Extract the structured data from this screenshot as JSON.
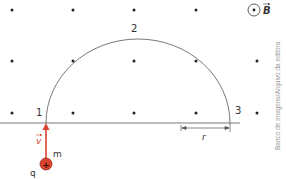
{
  "diagram": {
    "field": {
      "symbol": "B",
      "direction": "out of page",
      "icon": "dot-in-circle-icon"
    },
    "points": [
      {
        "label": "1",
        "role": "entry point"
      },
      {
        "label": "2",
        "role": "top of trajectory"
      },
      {
        "label": "3",
        "role": "exit point"
      }
    ],
    "particle": {
      "charge_label": "q",
      "mass_label": "m",
      "sign": "+",
      "velocity_label": "v"
    },
    "dimension": {
      "label": "r"
    },
    "credit": "Banco de imagens/Arquivo da editora",
    "colors": {
      "velocity_arrow": "#d9432f",
      "particle_fill": "#d9432f",
      "line": "#555555",
      "dots": "#222222"
    }
  }
}
